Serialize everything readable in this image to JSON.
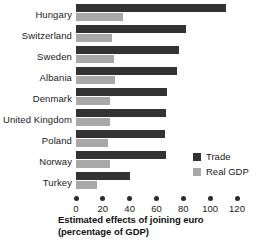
{
  "chart_data": {
    "type": "bar",
    "orientation": "horizontal",
    "title": "",
    "xlabel": "Estimated effects of joining euro (percentage of GDP)",
    "ylabel": "",
    "categories": [
      "Hungary",
      "Switzerland",
      "Sweden",
      "Albania",
      "Denmark",
      "United Kingdom",
      "Poland",
      "Norway",
      "Turkey"
    ],
    "series": [
      {
        "name": "Trade",
        "color": "#333333",
        "values": [
          112,
          82,
          77,
          75,
          68,
          67,
          66,
          67,
          40
        ]
      },
      {
        "name": "Real GDP",
        "color": "#a8a8a8",
        "values": [
          35,
          27,
          28,
          29,
          25,
          25,
          24,
          25,
          16
        ]
      }
    ],
    "xlim": [
      0,
      120
    ],
    "xticks": [
      0,
      20,
      40,
      60,
      80,
      100,
      120
    ],
    "xtick_labels": [
      "0",
      "20",
      "40",
      "60",
      "80",
      "100",
      "120"
    ],
    "grid": false,
    "legend_position": "center-right"
  },
  "axis_title": {
    "line1": "Estimated effects of joining euro",
    "line2": "(percentage of GDP)"
  },
  "legend": {
    "items": [
      {
        "label": "Trade",
        "color": "#333333"
      },
      {
        "label": "Real GDP",
        "color": "#a8a8a8"
      }
    ]
  },
  "colors": {
    "trade": "#333333",
    "real_gdp": "#a8a8a8",
    "text": "#1a1a1a",
    "background": "#ffffff"
  }
}
